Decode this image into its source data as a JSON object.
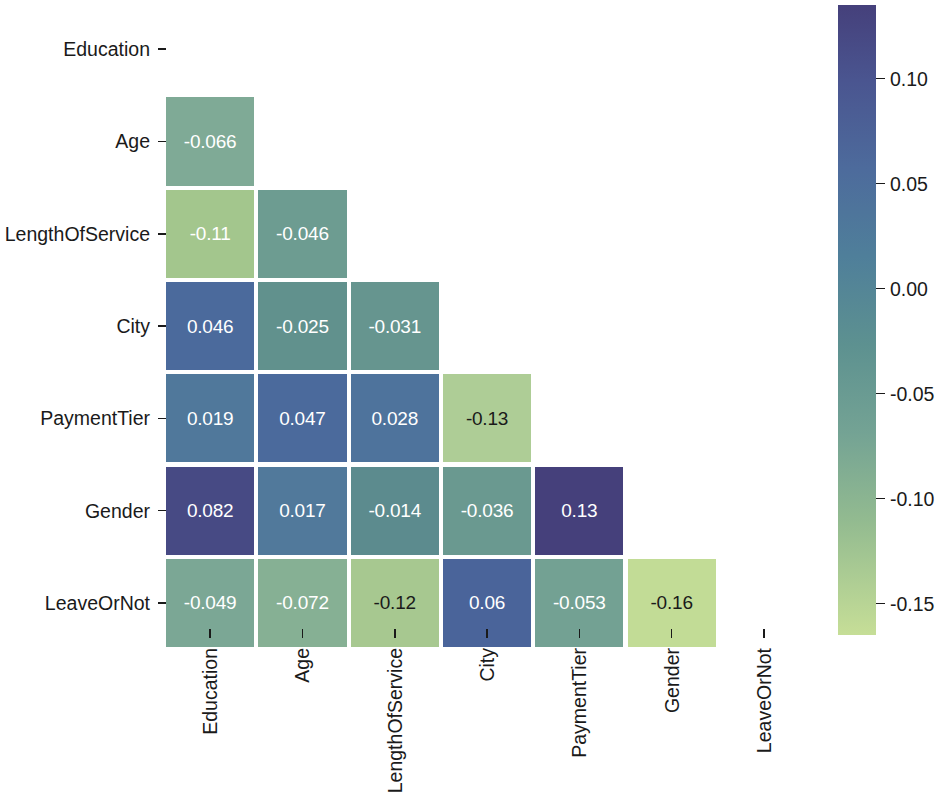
{
  "chart_data": {
    "type": "heatmap",
    "title": "",
    "subtitle": "",
    "xlabel": "",
    "ylabel": "",
    "variant": "lower-triangle correlation matrix",
    "mask": "upper triangle including diagonal hidden",
    "grid": false,
    "annotated": true,
    "categories": [
      "Education",
      "Age",
      "LengthOfService",
      "City",
      "PaymentTier",
      "Gender",
      "LeaveOrNot"
    ],
    "x_tick_labels": [
      "Education",
      "Age",
      "LengthOfService",
      "City",
      "PaymentTier",
      "Gender",
      "LeaveOrNot"
    ],
    "y_tick_labels": [
      "Education",
      "Age",
      "LengthOfService",
      "City",
      "PaymentTier",
      "Gender",
      "LeaveOrNot"
    ],
    "x_tick_rotation": 90,
    "matrix": [
      [
        null,
        null,
        null,
        null,
        null,
        null,
        null
      ],
      [
        -0.066,
        null,
        null,
        null,
        null,
        null,
        null
      ],
      [
        -0.11,
        -0.046,
        null,
        null,
        null,
        null,
        null
      ],
      [
        0.046,
        -0.025,
        -0.031,
        null,
        null,
        null,
        null
      ],
      [
        0.019,
        0.047,
        0.028,
        -0.13,
        null,
        null,
        null
      ],
      [
        0.082,
        0.017,
        -0.014,
        -0.036,
        0.13,
        null,
        null
      ],
      [
        -0.049,
        -0.072,
        -0.12,
        0.06,
        -0.053,
        -0.16,
        null
      ]
    ],
    "cells": [
      {
        "row": 1,
        "col": 0,
        "row_label": "Age",
        "col_label": "Education",
        "value": -0.066,
        "text": "-0.066",
        "color": "#7faa96",
        "text_color": "#ffffff"
      },
      {
        "row": 2,
        "col": 0,
        "row_label": "LengthOfService",
        "col_label": "Education",
        "value": -0.11,
        "text": "-0.11",
        "color": "#a3c68d",
        "text_color": "#ffffff"
      },
      {
        "row": 2,
        "col": 1,
        "row_label": "LengthOfService",
        "col_label": "Age",
        "value": -0.046,
        "text": "-0.046",
        "color": "#6d9c91",
        "text_color": "#ffffff"
      },
      {
        "row": 3,
        "col": 0,
        "row_label": "City",
        "col_label": "Education",
        "value": 0.046,
        "text": "0.046",
        "color": "#4b6a9c",
        "text_color": "#ffffff"
      },
      {
        "row": 3,
        "col": 1,
        "row_label": "City",
        "col_label": "Age",
        "value": -0.025,
        "text": "-0.025",
        "color": "#61918d",
        "text_color": "#ffffff"
      },
      {
        "row": 3,
        "col": 2,
        "row_label": "City",
        "col_label": "LengthOfService",
        "value": -0.031,
        "text": "-0.031",
        "color": "#66958f",
        "text_color": "#ffffff"
      },
      {
        "row": 4,
        "col": 0,
        "row_label": "PaymentTier",
        "col_label": "Education",
        "value": 0.019,
        "text": "0.019",
        "color": "#50789b",
        "text_color": "#ffffff"
      },
      {
        "row": 4,
        "col": 1,
        "row_label": "PaymentTier",
        "col_label": "Age",
        "value": 0.047,
        "text": "0.047",
        "color": "#4b6a9c",
        "text_color": "#ffffff"
      },
      {
        "row": 4,
        "col": 2,
        "row_label": "PaymentTier",
        "col_label": "LengthOfService",
        "value": 0.028,
        "text": "0.028",
        "color": "#4e739c",
        "text_color": "#ffffff"
      },
      {
        "row": 4,
        "col": 3,
        "row_label": "PaymentTier",
        "col_label": "City",
        "value": -0.13,
        "text": "-0.13",
        "color": "#aecd96",
        "text_color": "#1a1a1a"
      },
      {
        "row": 5,
        "col": 0,
        "row_label": "Gender",
        "col_label": "Education",
        "value": 0.082,
        "text": "0.082",
        "color": "#474a84",
        "text_color": "#ffffff"
      },
      {
        "row": 5,
        "col": 1,
        "row_label": "Gender",
        "col_label": "Age",
        "value": 0.017,
        "text": "0.017",
        "color": "#51799b",
        "text_color": "#ffffff"
      },
      {
        "row": 5,
        "col": 2,
        "row_label": "Gender",
        "col_label": "LengthOfService",
        "value": -0.014,
        "text": "-0.014",
        "color": "#5c8b8e",
        "text_color": "#ffffff"
      },
      {
        "row": 5,
        "col": 3,
        "row_label": "Gender",
        "col_label": "City",
        "value": -0.036,
        "text": "-0.036",
        "color": "#6a9990",
        "text_color": "#ffffff"
      },
      {
        "row": 5,
        "col": 4,
        "row_label": "Gender",
        "col_label": "PaymentTier",
        "value": 0.13,
        "text": "0.13",
        "color": "#45407b",
        "text_color": "#ffffff"
      },
      {
        "row": 6,
        "col": 0,
        "row_label": "LeaveOrNot",
        "col_label": "Education",
        "value": -0.049,
        "text": "-0.049",
        "color": "#7ba795",
        "text_color": "#ffffff"
      },
      {
        "row": 6,
        "col": 1,
        "row_label": "LeaveOrNot",
        "col_label": "Age",
        "value": -0.072,
        "text": "-0.072",
        "color": "#86b094",
        "text_color": "#ffffff"
      },
      {
        "row": 6,
        "col": 2,
        "row_label": "LeaveOrNot",
        "col_label": "LengthOfService",
        "value": -0.12,
        "text": "-0.12",
        "color": "#a7c890",
        "text_color": "#1a1a1a"
      },
      {
        "row": 6,
        "col": 3,
        "row_label": "LeaveOrNot",
        "col_label": "City",
        "value": 0.06,
        "text": "0.06",
        "color": "#4a649a",
        "text_color": "#ffffff"
      },
      {
        "row": 6,
        "col": 4,
        "row_label": "LeaveOrNot",
        "col_label": "PaymentTier",
        "value": -0.053,
        "text": "-0.053",
        "color": "#73a193",
        "text_color": "#ffffff"
      },
      {
        "row": 6,
        "col": 5,
        "row_label": "LeaveOrNot",
        "col_label": "Gender",
        "value": -0.16,
        "text": "-0.16",
        "color": "#c2dc96",
        "text_color": "#1a1a1a"
      }
    ],
    "colorbar": {
      "orientation": "vertical",
      "vmin": -0.165,
      "vmax": 0.135,
      "tick_values": [
        0.1,
        0.05,
        0.0,
        -0.05,
        -0.1,
        -0.15
      ],
      "tick_labels": [
        "0.10",
        "0.05",
        "0.00",
        "-0.05",
        "-0.10",
        "-0.15"
      ],
      "colormap_name": "crest-like green-to-indigo",
      "gradient_stops": [
        {
          "pos": 0,
          "color": "#45407b"
        },
        {
          "pos": 0.12,
          "color": "#4a5590"
        },
        {
          "pos": 0.26,
          "color": "#4d6b9c"
        },
        {
          "pos": 0.4,
          "color": "#4f7f9a"
        },
        {
          "pos": 0.54,
          "color": "#5d9190"
        },
        {
          "pos": 0.68,
          "color": "#74a394"
        },
        {
          "pos": 0.82,
          "color": "#93bb90"
        },
        {
          "pos": 1,
          "color": "#c6de97"
        }
      ]
    },
    "axis_geometry": {
      "plot_left": 166,
      "plot_top": 5,
      "cell_size": 92.3,
      "n": 7
    }
  }
}
